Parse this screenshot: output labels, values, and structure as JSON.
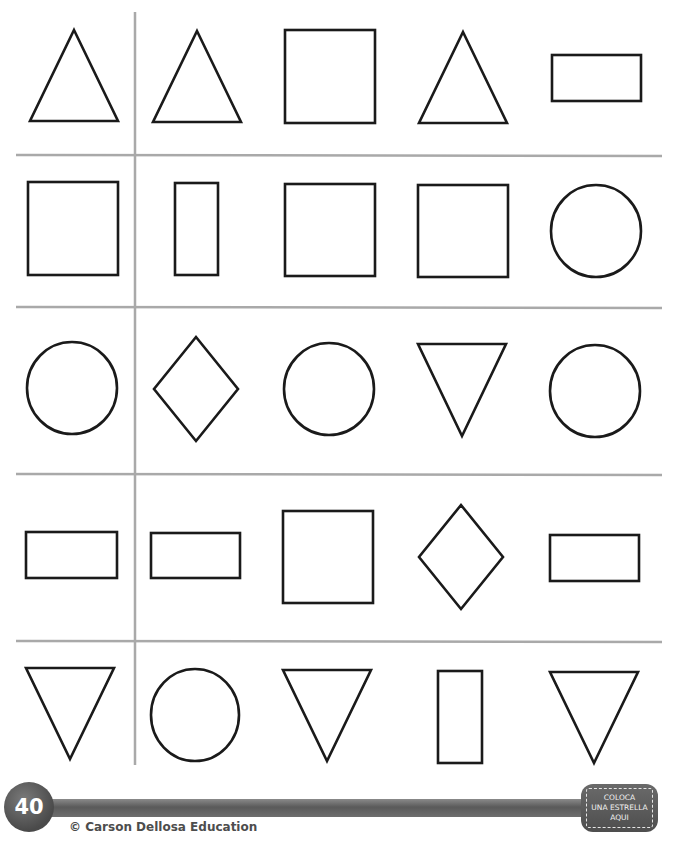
{
  "worksheet": {
    "grid": {
      "line_color": "#a9a9a9",
      "stroke_color": "#1a1a1a",
      "horizontal_lines_y": [
        155,
        307,
        474,
        641
      ],
      "vertical_line_x": 135,
      "rows": [
        {
          "shapes": [
            {
              "type": "triangle-up",
              "cx": 74,
              "top": 30,
              "bottom": 121,
              "halfw": 44
            },
            {
              "type": "triangle-up",
              "cx": 197,
              "top": 31,
              "bottom": 122,
              "halfw": 44
            },
            {
              "type": "rect",
              "x": 285,
              "y": 30,
              "w": 90,
              "h": 93
            },
            {
              "type": "triangle-up",
              "cx": 463,
              "top": 32,
              "bottom": 123,
              "halfw": 44
            },
            {
              "type": "rect",
              "x": 552,
              "y": 55,
              "w": 89,
              "h": 46
            }
          ]
        },
        {
          "shapes": [
            {
              "type": "rect",
              "x": 28,
              "y": 182,
              "w": 90,
              "h": 93
            },
            {
              "type": "rect",
              "x": 175,
              "y": 183,
              "w": 43,
              "h": 92
            },
            {
              "type": "rect",
              "x": 285,
              "y": 184,
              "w": 90,
              "h": 92
            },
            {
              "type": "rect",
              "x": 418,
              "y": 185,
              "w": 90,
              "h": 92
            },
            {
              "type": "ellipse",
              "cx": 596,
              "cy": 231,
              "rx": 45,
              "ry": 46
            }
          ]
        },
        {
          "shapes": [
            {
              "type": "ellipse",
              "cx": 72,
              "cy": 388,
              "rx": 45,
              "ry": 46
            },
            {
              "type": "diamond",
              "cx": 196,
              "cy": 389,
              "halfw": 42,
              "halfh": 52
            },
            {
              "type": "ellipse",
              "cx": 329,
              "cy": 389,
              "rx": 45,
              "ry": 46
            },
            {
              "type": "triangle-down",
              "cx": 462,
              "top": 344,
              "bottom": 436,
              "halfw": 44
            },
            {
              "type": "ellipse",
              "cx": 595,
              "cy": 391,
              "rx": 45,
              "ry": 46
            }
          ]
        },
        {
          "shapes": [
            {
              "type": "rect",
              "x": 26,
              "y": 532,
              "w": 91,
              "h": 46
            },
            {
              "type": "rect",
              "x": 151,
              "y": 533,
              "w": 89,
              "h": 45
            },
            {
              "type": "rect",
              "x": 283,
              "y": 511,
              "w": 90,
              "h": 92
            },
            {
              "type": "diamond",
              "cx": 461,
              "cy": 557,
              "halfw": 42,
              "halfh": 52
            },
            {
              "type": "rect",
              "x": 550,
              "y": 535,
              "w": 89,
              "h": 46
            }
          ]
        },
        {
          "shapes": [
            {
              "type": "triangle-down",
              "cx": 70,
              "top": 668,
              "bottom": 759,
              "halfw": 44
            },
            {
              "type": "ellipse",
              "cx": 195,
              "cy": 715,
              "rx": 44,
              "ry": 46
            },
            {
              "type": "triangle-down",
              "cx": 327,
              "top": 670,
              "bottom": 761,
              "halfw": 44
            },
            {
              "type": "rect",
              "x": 438,
              "y": 671,
              "w": 44,
              "h": 92
            },
            {
              "type": "triangle-down",
              "cx": 594,
              "top": 672,
              "bottom": 763,
              "halfw": 44
            }
          ]
        }
      ]
    }
  },
  "footer": {
    "page_number": "40",
    "copyright": "© Carson Dellosa Education",
    "star_box": {
      "lines": [
        "COLOCA",
        "UNA ESTRELLA",
        "AQUI"
      ]
    }
  }
}
